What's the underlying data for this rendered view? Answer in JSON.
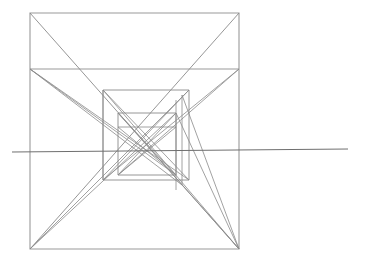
{
  "document": {
    "title": "One-point perspective nested square construction",
    "background_color": "#ffffff",
    "width": 371,
    "height": 267
  },
  "style": {
    "line_color": "#8a8a8a",
    "frame_color": "#9a9a9a",
    "horizon_color": "#6f6f6f",
    "line_width": 0.9
  },
  "chart_data": {
    "type": "diagram",
    "xlabel": "",
    "ylabel": "",
    "xlim": [
      0,
      371
    ],
    "ylim": [
      0,
      267
    ],
    "grid": false,
    "legend": null,
    "vanishing_point": {
      "x": 152,
      "y": 152
    },
    "horizon_line": {
      "x1": 12,
      "y1": 152,
      "x2": 348,
      "y2": 149
    },
    "squares": [
      {
        "name": "outer-frame",
        "x1": 30,
        "y1": 13,
        "x2": 239,
        "y2": 249
      },
      {
        "name": "upper-band-line",
        "x1": 30,
        "y1": 69,
        "x2": 239,
        "y2": 69
      },
      {
        "name": "second-square",
        "x1": 103,
        "y1": 90,
        "x2": 189,
        "y2": 180
      },
      {
        "name": "third-square",
        "x1": 118,
        "y1": 113,
        "x2": 176,
        "y2": 175
      },
      {
        "name": "inner-square",
        "x1": 118,
        "y1": 127,
        "x2": 176,
        "y2": 175
      }
    ],
    "converging_diagonals": [
      {
        "from": [
          30,
          13
        ],
        "to": [
          239,
          249
        ]
      },
      {
        "from": [
          239,
          13
        ],
        "to": [
          30,
          249
        ]
      },
      {
        "from": [
          30,
          69
        ],
        "to": [
          189,
          180
        ]
      },
      {
        "from": [
          239,
          69
        ],
        "to": [
          103,
          180
        ]
      },
      {
        "from": [
          30,
          69
        ],
        "to": [
          176,
          175
        ]
      },
      {
        "from": [
          239,
          69
        ],
        "to": [
          118,
          175
        ]
      }
    ],
    "verticals": [
      {
        "x": 103,
        "y1": 90,
        "y2": 180
      },
      {
        "x": 189,
        "y1": 90,
        "y2": 180
      },
      {
        "x": 176,
        "y1": 100,
        "y2": 190
      },
      {
        "x": 182,
        "y1": 95,
        "y2": 185
      }
    ]
  },
  "labels": {
    "none": ""
  }
}
